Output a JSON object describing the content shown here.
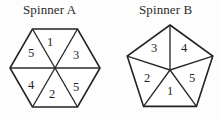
{
  "figure": {
    "background_color": "#fdfdfd",
    "line_color": "#232323",
    "text_color": "#1f1f1f"
  },
  "spinners": [
    {
      "id": "spinner-a",
      "title": "Spinner A",
      "shape": "hexagon",
      "sides": 6,
      "center": {
        "x": 55,
        "y": 68
      },
      "radius": 45,
      "sectors": [
        {
          "position": "top",
          "label": "1",
          "x": 50,
          "y": 43
        },
        {
          "position": "upper-right",
          "label": "3",
          "x": 76,
          "y": 56
        },
        {
          "position": "lower-right",
          "label": "5",
          "x": 76,
          "y": 88
        },
        {
          "position": "bottom",
          "label": "2",
          "x": 52,
          "y": 95
        },
        {
          "position": "lower-left",
          "label": "4",
          "x": 31,
          "y": 86
        },
        {
          "position": "upper-left",
          "label": "5",
          "x": 31,
          "y": 54
        }
      ]
    },
    {
      "id": "spinner-b",
      "title": "Spinner B",
      "shape": "pentagon",
      "sides": 5,
      "center": {
        "x": 170,
        "y": 70
      },
      "radius": 45,
      "sectors": [
        {
          "position": "upper-left",
          "label": "3",
          "x": 154,
          "y": 49
        },
        {
          "position": "upper-right",
          "label": "4",
          "x": 184,
          "y": 49
        },
        {
          "position": "right",
          "label": "5",
          "x": 192,
          "y": 79
        },
        {
          "position": "bottom",
          "label": "1",
          "x": 170,
          "y": 92
        },
        {
          "position": "left",
          "label": "2",
          "x": 147,
          "y": 79
        }
      ]
    }
  ]
}
